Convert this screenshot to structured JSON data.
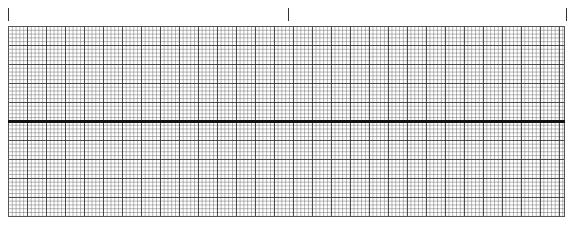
{
  "strip": {
    "ticks": [
      {
        "x": 8
      },
      {
        "x": 288
      },
      {
        "x": 566
      }
    ],
    "grid": {
      "left": 8,
      "top": 26,
      "width": 557,
      "height": 191,
      "minor_spacing_px": 3.8,
      "major_spacing_px": 19,
      "line_color": "#282828"
    },
    "baseline": {
      "y": 120,
      "color": "#111111"
    }
  }
}
